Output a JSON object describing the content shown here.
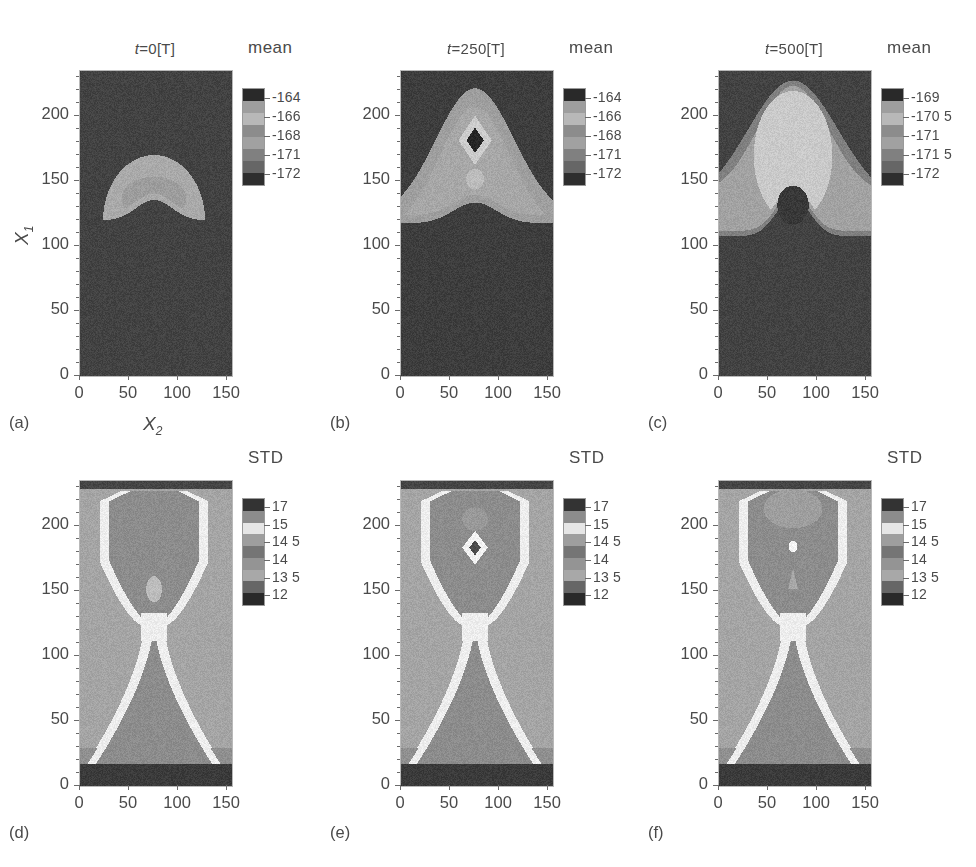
{
  "figure": {
    "domain": "Chart",
    "background": "#ffffff",
    "rows": 2,
    "cols": 3
  },
  "axes": {
    "xlabel": "X",
    "xlabel_sub": "2",
    "ylabel": "X",
    "ylabel_sub": "1",
    "xticks": [
      0,
      50,
      100,
      150
    ],
    "yticks": [
      0,
      50,
      100,
      150,
      200
    ],
    "xlim": [
      0,
      155
    ],
    "ylim": [
      0,
      235
    ]
  },
  "panels": [
    {
      "id": "a",
      "label": "(a)",
      "title_var": "t",
      "title_eq": "=0[T]",
      "title_full": "t =0[T]",
      "row": 0,
      "col": 0,
      "quantity": "mean",
      "show_ylabels": true
    },
    {
      "id": "b",
      "label": "(b)",
      "title_var": "t",
      "title_eq": "=250[T]",
      "title_full": "t =250[T]",
      "row": 0,
      "col": 1,
      "quantity": "mean",
      "show_ylabels": true
    },
    {
      "id": "c",
      "label": "(c)",
      "title_var": "t",
      "title_eq": "=500[T]",
      "title_full": "t =500[T]",
      "row": 0,
      "col": 2,
      "quantity": "mean",
      "show_ylabels": true
    },
    {
      "id": "d",
      "label": "(d)",
      "title_var": "",
      "title_eq": "",
      "title_full": "",
      "row": 1,
      "col": 0,
      "quantity": "STD",
      "show_ylabels": true
    },
    {
      "id": "e",
      "label": "(e)",
      "title_var": "",
      "title_eq": "",
      "title_full": "",
      "row": 1,
      "col": 1,
      "quantity": "STD",
      "show_ylabels": true
    },
    {
      "id": "f",
      "label": "(f)",
      "title_var": "",
      "title_eq": "",
      "title_full": "",
      "row": 1,
      "col": 2,
      "quantity": "STD",
      "show_ylabels": true
    }
  ],
  "colorbars": [
    {
      "panel": "a",
      "title": "mean",
      "labels": [
        "-164",
        "-166",
        "-168",
        "-171",
        "-172"
      ],
      "levels": [
        -164,
        -166,
        -168,
        -171,
        -172
      ]
    },
    {
      "panel": "b",
      "title": "mean",
      "labels": [
        "-164",
        "-166",
        "-168",
        "-171",
        "-172"
      ],
      "levels": [
        -164,
        -166,
        -168,
        -171,
        -172
      ]
    },
    {
      "panel": "c",
      "title": "mean",
      "labels": [
        "-169",
        "-170 5",
        "-171",
        "-171 5",
        "-172"
      ],
      "levels": [
        -169,
        -170.5,
        -171,
        -171.5,
        -172
      ]
    },
    {
      "panel": "d",
      "title": "STD",
      "labels": [
        "17",
        "15",
        "14 5",
        "14",
        "13 5",
        "12"
      ],
      "levels": [
        17,
        15,
        14.5,
        14,
        13.5,
        12
      ]
    },
    {
      "panel": "e",
      "title": "STD",
      "labels": [
        "17",
        "15",
        "14 5",
        "14",
        "13 5",
        "12"
      ],
      "levels": [
        17,
        15,
        14.5,
        14,
        13.5,
        12
      ]
    },
    {
      "panel": "f",
      "title": "STD",
      "labels": [
        "17",
        "15",
        "14 5",
        "14",
        "13 5",
        "12"
      ],
      "levels": [
        17,
        15,
        14.5,
        14,
        13.5,
        12
      ]
    }
  ],
  "chart_data": {
    "type": "heatmap",
    "title": "",
    "xlabel": "X2",
    "ylabel": "X1",
    "xlim": [
      0,
      155
    ],
    "ylim": [
      0,
      235
    ],
    "grid": false,
    "legend_position": "right-of-each-panel",
    "colormap": "grayscale",
    "panels": [
      {
        "id": "a",
        "title": "t =0[T]",
        "quantity": "mean",
        "colorbar_levels": [
          -164,
          -166,
          -168,
          -171,
          -172
        ],
        "colorbar_labels": [
          "-164",
          "-166",
          "-168",
          "-171",
          "-172"
        ],
        "description": "Uniform dark background (value ~ -172) with a single bright dome-shaped region centred near X2=75, spanning X1 = 118 to 168, peak value ~ -166. A faint inner contour (~ -168) sits inside the dome around X1 = 125-155.",
        "features": [
          {
            "name": "background",
            "value": -172,
            "shade": 0.26
          },
          {
            "name": "dome",
            "center": [
              75,
              143
            ],
            "rx": 48,
            "ry": 26,
            "value": -166,
            "shade": 0.66
          },
          {
            "name": "dome-inner",
            "center": [
              75,
              137
            ],
            "rx": 30,
            "ry": 15,
            "value": -168,
            "shade": 0.6
          }
        ]
      },
      {
        "id": "b",
        "title": "t =250[T]",
        "quantity": "mean",
        "colorbar_levels": [
          -164,
          -166,
          -168,
          -171,
          -172
        ],
        "colorbar_labels": [
          "-164",
          "-166",
          "-168",
          "-171",
          "-172"
        ],
        "description": "Dark background with a large bell-shaped plume rising from X1=120 to X1=225, centred at X2=75. Inside the plume a bright ring (~ -166) encircles a dark diamond core (~ -172) at (75, 182). A small bright blob (~ -166) sits at (75, 152).",
        "features": [
          {
            "name": "background",
            "value": -172,
            "shade": 0.24
          },
          {
            "name": "plume",
            "value": -168,
            "shade": 0.62
          },
          {
            "name": "plume-inner",
            "value": -167,
            "shade": 0.66
          },
          {
            "name": "bright-ring",
            "center": [
              75,
              182
            ],
            "value": -166,
            "shade": 0.8
          },
          {
            "name": "diamond-core",
            "center": [
              75,
              182
            ],
            "value": -172,
            "shade": 0.16
          },
          {
            "name": "small-blob",
            "center": [
              75,
              152
            ],
            "value": -166,
            "shade": 0.74
          }
        ]
      },
      {
        "id": "c",
        "title": "t =500[T]",
        "quantity": "mean",
        "colorbar_levels": [
          -169,
          -170.5,
          -171,
          -171.5,
          -172
        ],
        "colorbar_labels": [
          "-169",
          "-170 5",
          "-171",
          "-171 5",
          "-172"
        ],
        "description": "Dark background below X1~110 with nested oval contours forming a broad mushroom cap from X1=115 to X1=225. Outer band ~ -171, middle band ~ -170.5, bright core ~ -169 spanning X1=130-215. A dark round void (~ -172) sits at (75, 132).",
        "features": [
          {
            "name": "background",
            "value": -172,
            "shade": 0.26
          },
          {
            "name": "outer-band",
            "value": -171.5,
            "shade": 0.5
          },
          {
            "name": "mid-band",
            "value": -171,
            "shade": 0.62
          },
          {
            "name": "bright-core",
            "value": -169,
            "shade": 0.78
          },
          {
            "name": "dark-void",
            "center": [
              75,
              132
            ],
            "rx": 15,
            "ry": 14,
            "value": -172,
            "shade": 0.22
          }
        ]
      },
      {
        "id": "d",
        "quantity": "STD",
        "colorbar_levels": [
          17,
          15,
          14.5,
          14,
          13.5,
          12
        ],
        "colorbar_labels": [
          "17",
          "15",
          "14 5",
          "14",
          "13 5",
          "12"
        ],
        "description": "Hourglass / X-shaped pattern. A bright band (STD ~ 15) traces two lobes: an upper rounded rectangle from X1=130 to X1=228 and a lower flaring V from X1=20 to X1=120, crossing at a waist near (75, 122). Interior of both lobes is mid-grey (STD ~ 14). Background outside the bands is light grey (STD ~ 14.5). Dark strips (STD ~ 12) at the very top (X1>230) and bottom (X1<18). Small bright ovoid at (75, 152).",
        "features": [
          {
            "name": "top-dark-strip",
            "value": 12,
            "shade": 0.28
          },
          {
            "name": "bottom-dark-strip",
            "value": 12,
            "shade": 0.24
          },
          {
            "name": "field",
            "value": 14.5,
            "shade": 0.64
          },
          {
            "name": "bright-band",
            "value": 15,
            "shade": 0.92
          },
          {
            "name": "lobe-interior",
            "value": 14,
            "shade": 0.55
          },
          {
            "name": "small-ovoid",
            "center": [
              75,
              152
            ],
            "value": 15,
            "shade": 0.74
          }
        ]
      },
      {
        "id": "e",
        "quantity": "STD",
        "colorbar_levels": [
          17,
          15,
          14.5,
          14,
          13.5,
          12
        ],
        "colorbar_labels": [
          "17",
          "15",
          "14 5",
          "14",
          "13 5",
          "12"
        ],
        "description": "Same hourglass topology as (d). Upper lobe contains a bright diamond ring with a dark core at (75, 184) and a faint lighter patch near (75, 205). Lower V lobe is unchanged. Dark strips top and bottom.",
        "features": [
          {
            "name": "top-dark-strip",
            "value": 12,
            "shade": 0.26
          },
          {
            "name": "bottom-dark-strip",
            "value": 12,
            "shade": 0.24
          },
          {
            "name": "field",
            "value": 14.5,
            "shade": 0.64
          },
          {
            "name": "bright-band",
            "value": 15,
            "shade": 0.92
          },
          {
            "name": "lobe-interior",
            "value": 14,
            "shade": 0.55
          },
          {
            "name": "diamond-ring",
            "center": [
              75,
              184
            ],
            "value": 15,
            "shade": 0.93
          },
          {
            "name": "diamond-core",
            "center": [
              75,
              184
            ],
            "value": 13.5,
            "shade": 0.3
          },
          {
            "name": "faint-patch",
            "center": [
              75,
              206
            ],
            "value": 14.5,
            "shade": 0.6
          }
        ]
      },
      {
        "id": "f",
        "quantity": "STD",
        "colorbar_levels": [
          17,
          15,
          14.5,
          14,
          13.5,
          12
        ],
        "colorbar_labels": [
          "17",
          "15",
          "14 5",
          "14",
          "13 5",
          "12"
        ],
        "description": "Same hourglass topology as (d) and (e). Upper lobe shows a lighter cap near X1=205-225, a tiny bright dot at (75, 185) and a small teardrop at (75, 160). Lower V lobe unchanged. Dark strips top and bottom.",
        "features": [
          {
            "name": "top-dark-strip",
            "value": 12,
            "shade": 0.28
          },
          {
            "name": "bottom-dark-strip",
            "value": 12,
            "shade": 0.22
          },
          {
            "name": "field",
            "value": 14.5,
            "shade": 0.64
          },
          {
            "name": "bright-band",
            "value": 15,
            "shade": 0.92
          },
          {
            "name": "lobe-interior",
            "value": 14,
            "shade": 0.55
          },
          {
            "name": "light-cap",
            "center": [
              75,
              212
            ],
            "value": 14.5,
            "shade": 0.62
          },
          {
            "name": "bright-dot",
            "center": [
              75,
              185
            ],
            "value": 15,
            "shade": 0.95
          },
          {
            "name": "teardrop",
            "center": [
              75,
              160
            ],
            "value": 14.5,
            "shade": 0.66
          }
        ]
      }
    ]
  }
}
